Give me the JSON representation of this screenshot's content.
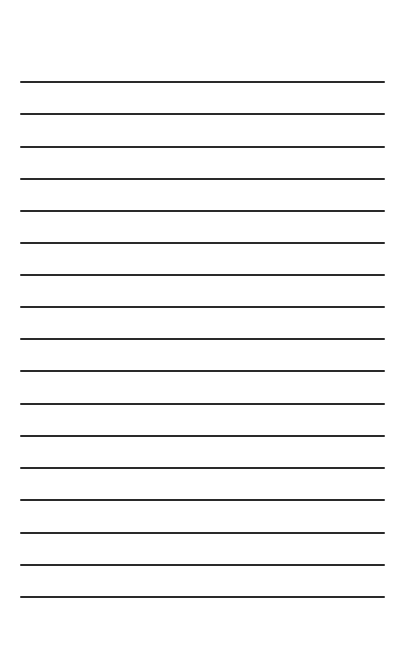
{
  "document": {
    "type": "lined-paper",
    "line_count": 17,
    "line_color": "#2a2a2a",
    "background_color": "#ffffff",
    "lines": [
      {
        "y": 82,
        "text": ""
      },
      {
        "y": 114,
        "text": ""
      },
      {
        "y": 147,
        "text": ""
      },
      {
        "y": 179,
        "text": ""
      },
      {
        "y": 211,
        "text": ""
      },
      {
        "y": 243,
        "text": ""
      },
      {
        "y": 275,
        "text": ""
      },
      {
        "y": 307,
        "text": ""
      },
      {
        "y": 339,
        "text": ""
      },
      {
        "y": 371,
        "text": ""
      },
      {
        "y": 404,
        "text": ""
      },
      {
        "y": 436,
        "text": ""
      },
      {
        "y": 468,
        "text": ""
      },
      {
        "y": 500,
        "text": ""
      },
      {
        "y": 533,
        "text": ""
      },
      {
        "y": 565,
        "text": ""
      },
      {
        "y": 597,
        "text": ""
      }
    ]
  }
}
